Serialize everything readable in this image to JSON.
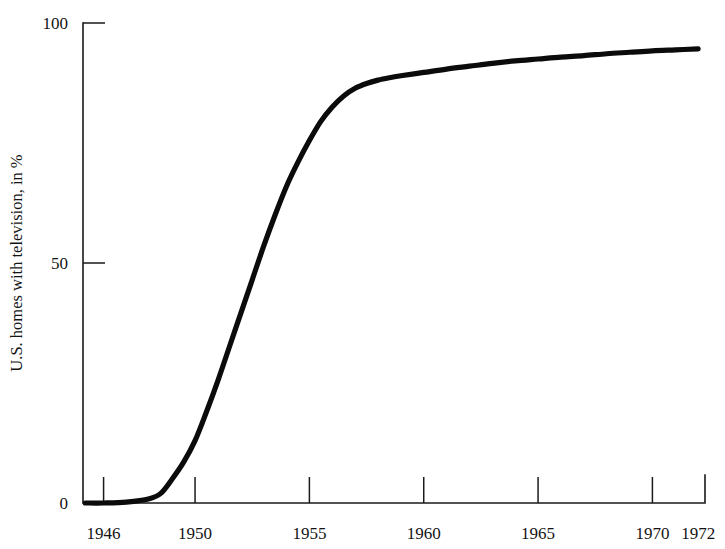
{
  "chart_data": {
    "type": "line",
    "title": "",
    "subtitle": "",
    "xlabel": "",
    "ylabel": "U.S. homes with television, in %",
    "xlim": [
      1945.1,
      1972.3
    ],
    "ylim": [
      0,
      100
    ],
    "grid": false,
    "legend": "none",
    "x_ticks": [
      1946,
      1950,
      1955,
      1960,
      1965,
      1970,
      1972
    ],
    "x_tick_labels": [
      "1946",
      "1950",
      "1955",
      "1960",
      "1965",
      "1970",
      "1972"
    ],
    "y_ticks": [
      0,
      50,
      100
    ],
    "y_tick_labels": [
      "0",
      "50",
      "100"
    ],
    "tick_direction": "in",
    "line_color": "#0b0b0b",
    "line_width_px": 5.2,
    "series": [
      {
        "name": "U.S. homes with television",
        "x": [
          1945.2,
          1946.0,
          1947.0,
          1948.0,
          1948.5,
          1949.0,
          1949.5,
          1950.0,
          1950.5,
          1951.0,
          1951.5,
          1952.0,
          1952.5,
          1953.0,
          1953.5,
          1954.0,
          1954.5,
          1955.0,
          1955.5,
          1956.0,
          1956.5,
          1957.0,
          1957.5,
          1958.0,
          1958.5,
          1959.0,
          1960.0,
          1961.0,
          1962.0,
          1963.0,
          1964.0,
          1965.0,
          1966.0,
          1967.0,
          1968.0,
          1969.0,
          1970.0,
          1971.0,
          1972.0
        ],
        "y": [
          0.0,
          0.0,
          0.2,
          0.9,
          2.0,
          5.0,
          8.5,
          13.0,
          19.0,
          25.5,
          32.5,
          39.5,
          46.5,
          53.5,
          60.0,
          66.0,
          71.0,
          75.5,
          79.5,
          82.5,
          84.8,
          86.4,
          87.4,
          88.1,
          88.6,
          89.0,
          89.7,
          90.4,
          91.0,
          91.6,
          92.1,
          92.5,
          92.9,
          93.2,
          93.6,
          93.9,
          94.2,
          94.4,
          94.6
        ]
      }
    ]
  },
  "plot_geometry": {
    "x_px_left": 83,
    "x_px_right": 705,
    "y_px_zero": 503,
    "y_px_hundred": 23,
    "tick_len_px": 11
  }
}
